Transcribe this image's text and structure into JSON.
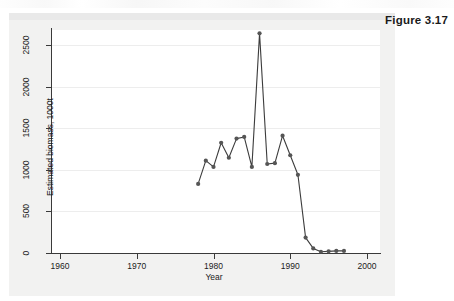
{
  "figure": {
    "label": "Figure 3.17"
  },
  "chart_data": {
    "type": "line",
    "title": "",
    "xlabel": "Year",
    "ylabel": "Estimated biomass, 1000t",
    "xlim": [
      1958,
      2002
    ],
    "ylim": [
      0,
      2700
    ],
    "xticks": [
      1960,
      1970,
      1980,
      1990,
      2000
    ],
    "yticks": [
      0,
      500,
      1000,
      1500,
      2000,
      2500
    ],
    "xtick_labels": [
      "1960",
      "1970",
      "1980",
      "1990",
      "2000"
    ],
    "ytick_labels": [
      "0",
      "500",
      "1000",
      "1500",
      "2000",
      "2500"
    ],
    "grid": "horizontal",
    "legend": "none",
    "marker": "filled-circle",
    "line_color": "#3c3c3c",
    "marker_color": "#555555",
    "series": [
      {
        "name": "Estimated biomass",
        "x": [
          1978,
          1979,
          1980,
          1981,
          1982,
          1983,
          1984,
          1985,
          1986,
          1987,
          1988,
          1989,
          1990,
          1991,
          1992,
          1993,
          1994,
          1995,
          1996,
          1997
        ],
        "values": [
          830,
          1110,
          1035,
          1325,
          1145,
          1375,
          1395,
          1035,
          2640,
          1070,
          1080,
          1410,
          1175,
          940,
          185,
          55,
          15,
          20,
          25,
          25
        ]
      }
    ]
  }
}
